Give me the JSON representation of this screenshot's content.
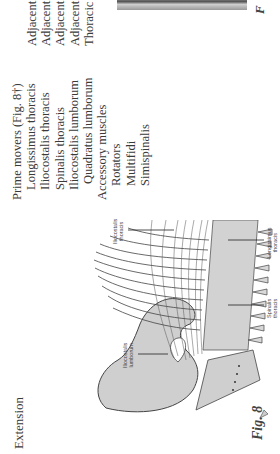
{
  "page": {
    "orientation": "rotated 90 degrees counterclockwise",
    "heading": "Extension",
    "prime_movers": {
      "title": "Prime movers (Fig. 8†)",
      "items": [
        "Longissimus thoracis",
        "Iliocostalis thoracis",
        "Spinalis thoracis",
        "Iliocostalis lumborum",
        "Quadratus lumborum"
      ]
    },
    "accessory_muscles": {
      "title": "Accessory muscles",
      "items": [
        "Rotators",
        "Multifidi",
        "Simispinalis"
      ]
    },
    "actions_column": [
      "Adjacent",
      "Adjacent",
      "Adjacent",
      "Adjacent",
      "Thoracic"
    ],
    "figure": {
      "caption": "Fig. 8",
      "labels": {
        "iliocostalis_thoracis": [
          "Iliocostalis",
          "thoracis"
        ],
        "iliocostalis_lumborum": [
          "Iliocostalis",
          "lumborum"
        ],
        "longissimus_thoracis": [
          "Longissimus",
          "thoracis"
        ],
        "spinalis_thoracis": [
          "Spinalis",
          "thoracis"
        ]
      }
    },
    "next_figure_caption_fragment": "F"
  }
}
